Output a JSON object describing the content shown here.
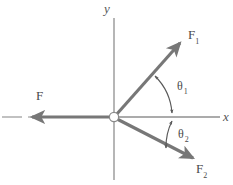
{
  "figure": {
    "type": "force-vector-diagram",
    "background_color": "#ffffff",
    "axis_color": "#8a8a8a",
    "vector_color": "#777777",
    "label_color": "#4a4a4a",
    "origin": {
      "x": 114,
      "y": 117,
      "marker": "open-circle"
    },
    "axes": {
      "x": {
        "label": "x",
        "from": {
          "x": 2,
          "y": 117
        },
        "to": {
          "x": 220,
          "y": 117
        }
      },
      "y": {
        "label": "y",
        "from": {
          "x": 114,
          "y": 18
        },
        "to": {
          "x": 114,
          "y": 180
        }
      }
    },
    "vectors": [
      {
        "name": "F1",
        "label": "F",
        "subscript": "1",
        "direction": "up-right",
        "angle_from_positive_x_axis_deg": 48,
        "tail": {
          "x": 114,
          "y": 117
        },
        "tip": {
          "x": 183,
          "y": 40
        }
      },
      {
        "name": "F2",
        "label": "F",
        "subscript": "2",
        "direction": "down-right",
        "angle_from_positive_x_axis_deg": -28,
        "tail": {
          "x": 114,
          "y": 117
        },
        "tip": {
          "x": 196,
          "y": 160
        }
      },
      {
        "name": "F",
        "label": "F",
        "subscript": "",
        "direction": "left",
        "angle_from_positive_x_axis_deg": 180,
        "tail": {
          "x": 114,
          "y": 117
        },
        "tip": {
          "x": 28,
          "y": 117
        }
      }
    ],
    "angles": [
      {
        "name": "theta1",
        "symbol": "θ",
        "subscript": "1",
        "between": [
          "F1",
          "x-axis"
        ],
        "arc_radius": 55,
        "arrow_style": "double-headed"
      },
      {
        "name": "theta2",
        "symbol": "θ",
        "subscript": "2",
        "between": [
          "x-axis",
          "F2"
        ],
        "arc_radius": 58,
        "arrow_style": "double-headed"
      }
    ],
    "dash_segment": {
      "name": "x-axis-left-dash",
      "from": {
        "x": 2,
        "y": 117
      },
      "to": {
        "x": 22,
        "y": 117
      }
    }
  }
}
